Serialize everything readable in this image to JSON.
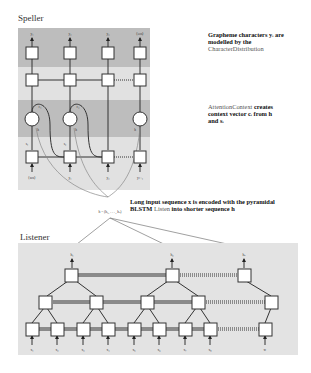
{
  "speller": {
    "title": "Speller",
    "outputs": [
      "y₁",
      "y₂",
      "y₃",
      "⟨eos⟩"
    ],
    "inputs": [
      "⟨sos⟩",
      "y₁",
      "y₂",
      "yₗ₋₁"
    ],
    "state_labels": [
      "s₁",
      "s₂"
    ],
    "context_labels": [
      "c₁",
      "c₂"
    ],
    "h_labels": [
      "h",
      "h",
      "h"
    ]
  },
  "annotations": {
    "grapheme_line1": "Grapheme characters yᵢ are",
    "grapheme_line2": "modelled by the",
    "grapheme_line3": "CharacterDistribution",
    "attention_line1a": "AttentionContext",
    "attention_line1b": " creates",
    "attention_line2": "context vector cᵢ from h",
    "attention_line3": "and sᵢ",
    "encoder_line1": "Long input sequence x is encoded with the pyramidal",
    "encoder_line2a": "BLSTM ",
    "encoder_line2b": "Listen",
    "encoder_line2c": " into shorter sequence h",
    "h_def": "h = (h₁, . . . , hᵤ)"
  },
  "listener": {
    "title": "Listener",
    "outputs": [
      "h₁",
      "h₂",
      "hᵤ"
    ],
    "inputs": [
      "x₁",
      "x₂",
      "x₃",
      "x₄",
      "x₅",
      "x₆",
      "x₇",
      "x₈",
      "xₜ"
    ]
  },
  "colors": {
    "dark_band": "#bdbdbd",
    "light_band": "#e1e1e1",
    "listener_bg": "#e3e3e3",
    "node_border": "#333333"
  }
}
